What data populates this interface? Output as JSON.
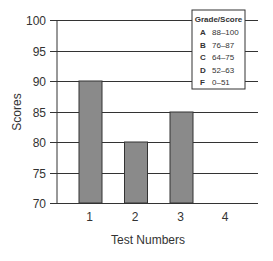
{
  "chart_data": {
    "type": "bar",
    "title": "",
    "xlabel": "Test Numbers",
    "ylabel": "Scores",
    "categories": [
      "1",
      "2",
      "3",
      "4"
    ],
    "values": [
      90,
      80,
      85,
      null
    ],
    "ylim": [
      70,
      100
    ],
    "yticks": [
      70,
      75,
      80,
      85,
      90,
      95,
      100
    ],
    "grid": true,
    "colors": {
      "bar_fill": "#8a8a8a",
      "bar_stroke": "#333333",
      "grid": "#333333"
    },
    "legend": {
      "title": "Grade/Score",
      "position": "top-right",
      "entries": [
        {
          "grade": "A",
          "range": "88–100"
        },
        {
          "grade": "B",
          "range": "76–87"
        },
        {
          "grade": "C",
          "range": "64–75"
        },
        {
          "grade": "D",
          "range": "52–63"
        },
        {
          "grade": "F",
          "range": "0–51"
        }
      ]
    }
  }
}
